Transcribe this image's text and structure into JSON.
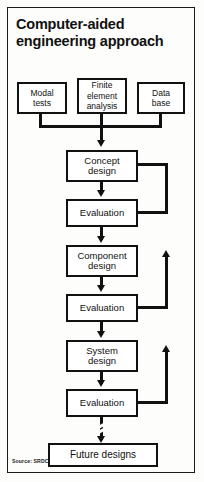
{
  "figure": {
    "title": "Computer-aided\nengineering approach",
    "source": "Source: SRDC",
    "colors": {
      "ink": "#111111",
      "paper": "#fdfdfb",
      "frame": "#1a1a1a"
    }
  },
  "diagram": {
    "type": "flowchart",
    "inputs": [
      {
        "id": "modal-tests",
        "label": "Modal\ntests"
      },
      {
        "id": "finite-element-analysis",
        "label": "Finite\nelement\nanalysis"
      },
      {
        "id": "data-base",
        "label": "Data\nbase"
      }
    ],
    "stages": [
      {
        "id": "concept-design",
        "label": "Concept\ndesign"
      },
      {
        "id": "evaluation-1",
        "label": "Evaluation"
      },
      {
        "id": "component-design",
        "label": "Component\ndesign"
      },
      {
        "id": "evaluation-2",
        "label": "Evaluation"
      },
      {
        "id": "system-design",
        "label": "System\ndesign"
      },
      {
        "id": "evaluation-3",
        "label": "Evaluation"
      }
    ],
    "outcome": {
      "id": "future-designs",
      "label": "Future designs"
    },
    "feedback_loops": [
      {
        "from": "evaluation-1",
        "to": "concept-design"
      },
      {
        "from": "evaluation-2",
        "to": "component-design"
      },
      {
        "from": "evaluation-3",
        "to": "system-design"
      }
    ],
    "connector_note": "broken line from evaluation-3 to future-designs"
  }
}
